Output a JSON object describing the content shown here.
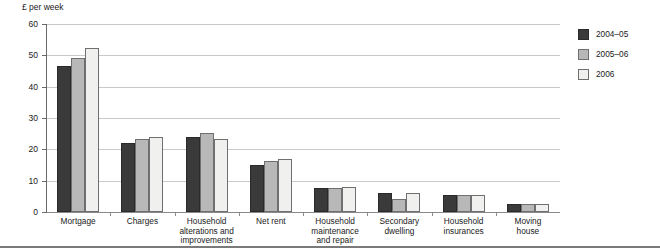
{
  "chart_data": {
    "type": "bar",
    "title": "",
    "subtitle": "",
    "xlabel": "",
    "ylabel": "£ per week",
    "ylim": [
      0,
      60
    ],
    "yticks": [
      0,
      10,
      20,
      30,
      40,
      50,
      60
    ],
    "grid": true,
    "legend_position": "right",
    "categories": [
      "Mortgage",
      "Charges",
      "Household alterations and improvements",
      "Net rent",
      "Household maintenance and repair",
      "Secondary dwelling",
      "Household insurances",
      "Moving house"
    ],
    "category_lines": [
      [
        "Mortgage"
      ],
      [
        "Charges"
      ],
      [
        "Household",
        "alterations and",
        "improvements"
      ],
      [
        "Net rent"
      ],
      [
        "Household",
        "maintenance",
        "and repair"
      ],
      [
        "Secondary",
        "dwelling"
      ],
      [
        "Household",
        "insurances"
      ],
      [
        "Moving",
        "house"
      ]
    ],
    "series": [
      {
        "name": "2004–05",
        "color": "#3a3a3a",
        "values": [
          46.5,
          22.0,
          24.0,
          15.0,
          7.7,
          6.0,
          5.3,
          2.4
        ]
      },
      {
        "name": "2005–06",
        "color": "#b8b8b8",
        "values": [
          49.0,
          23.2,
          25.3,
          16.3,
          7.8,
          4.3,
          5.4,
          2.6
        ]
      },
      {
        "name": "2006",
        "color": "#f0f0ef",
        "values": [
          52.2,
          24.1,
          23.3,
          17.0,
          8.1,
          6.0,
          5.3,
          2.7
        ]
      }
    ]
  },
  "legend": {
    "items": [
      {
        "label": "2004–05"
      },
      {
        "label": "2005–06"
      },
      {
        "label": "2006"
      }
    ]
  }
}
